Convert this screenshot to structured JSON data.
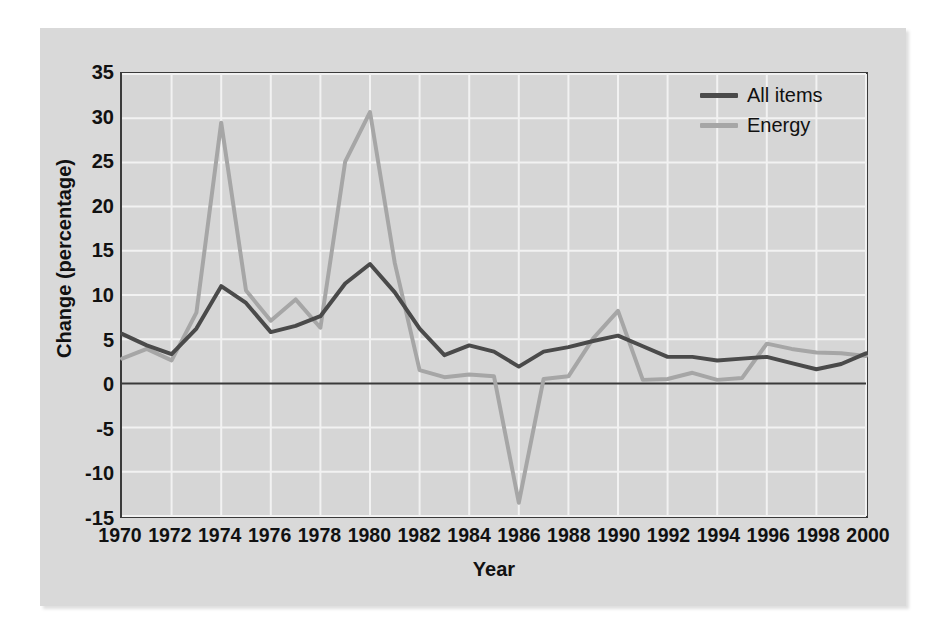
{
  "figure": {
    "background_color": "#d9d9d9",
    "plot_background_color": "#d6d6d6",
    "frame_color": "#3a3a3a",
    "gridline_color": "#f2f2f2"
  },
  "axes": {
    "y_title": "Change (percentage)",
    "x_title": "Year",
    "y_ticks": [
      "35",
      "30",
      "25",
      "20",
      "15",
      "10",
      "5",
      "0",
      "-5",
      "-10",
      "-15"
    ],
    "x_ticks": [
      "1970",
      "1972",
      "1974",
      "1976",
      "1978",
      "1980",
      "1982",
      "1984",
      "1986",
      "1988",
      "1990",
      "1992",
      "1994",
      "1996",
      "1998",
      "2000"
    ]
  },
  "legend": {
    "position": "top-right",
    "items": [
      {
        "label": "All items",
        "color": "#4a4a4a"
      },
      {
        "label": "Energy",
        "color": "#a6a6a6"
      }
    ]
  },
  "chart_data": {
    "type": "line",
    "title": "",
    "subtitle": "",
    "xlabel": "Year",
    "ylabel": "Change (percentage)",
    "xlim": [
      1970,
      2000
    ],
    "ylim": [
      -15,
      35
    ],
    "ytick_step": 5,
    "xtick_step": 2,
    "grid": true,
    "zero_line": true,
    "legend_entries": [
      "All items",
      "Energy"
    ],
    "x": [
      1970,
      1971,
      1972,
      1973,
      1974,
      1975,
      1976,
      1977,
      1978,
      1979,
      1980,
      1981,
      1982,
      1983,
      1984,
      1985,
      1986,
      1987,
      1988,
      1989,
      1990,
      1991,
      1992,
      1993,
      1994,
      1995,
      1996,
      1997,
      1998,
      1999,
      2000
    ],
    "series": [
      {
        "name": "All items",
        "color": "#4a4a4a",
        "values": [
          5.6,
          4.3,
          3.3,
          6.2,
          11.0,
          9.1,
          5.8,
          6.5,
          7.6,
          11.3,
          13.5,
          10.3,
          6.2,
          3.2,
          4.3,
          3.6,
          1.9,
          3.6,
          4.1,
          4.8,
          5.4,
          4.2,
          3.0,
          3.0,
          2.6,
          2.8,
          3.0,
          2.3,
          1.6,
          2.2,
          3.4
        ]
      },
      {
        "name": "Energy",
        "color": "#a6a6a6",
        "values": [
          2.8,
          3.9,
          2.6,
          8.0,
          29.5,
          10.5,
          7.1,
          9.5,
          6.3,
          25.1,
          30.7,
          13.6,
          1.5,
          0.7,
          1.0,
          0.8,
          -13.5,
          0.5,
          0.8,
          5.1,
          8.2,
          0.4,
          0.5,
          1.2,
          0.4,
          0.6,
          4.5,
          3.9,
          3.5,
          3.4,
          3.1
        ]
      }
    ]
  }
}
